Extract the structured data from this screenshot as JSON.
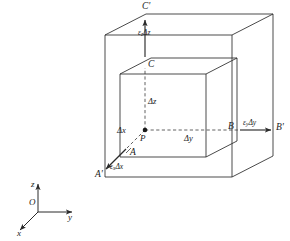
{
  "figure": {
    "name": "strain-deformation-cube",
    "colors": {
      "line": "#2b2b2b",
      "dashed": "#3a3a3a",
      "background": "#ffffff",
      "text": "#1a1a1a"
    },
    "outer_box": {
      "name": "deformed-outer-box",
      "vertices": {
        "A_prime": "A'",
        "B_prime": "B'",
        "C_prime": "C'"
      }
    },
    "inner_box": {
      "name": "original-inner-box",
      "vertices": {
        "A": "A",
        "B": "B",
        "C": "C"
      }
    },
    "center_point": "P",
    "dimension_labels": {
      "dx": "Δx",
      "dy": "Δy",
      "dz": "Δz"
    },
    "strain_labels": {
      "ex": "ε",
      "ex_sub": "x",
      "ex_rest": "Δx",
      "ey": "ε",
      "ey_sub": "y",
      "ey_rest": "Δy",
      "ez": "ε",
      "ez_sub": "z",
      "ez_rest": "Δz"
    },
    "axes": {
      "origin": "O",
      "x_axis": "x",
      "y_axis": "y",
      "z_axis": "z"
    }
  }
}
